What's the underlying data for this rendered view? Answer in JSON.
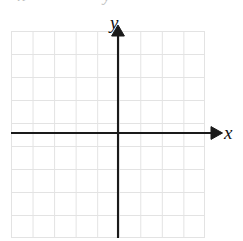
{
  "figure": {
    "kind": "blank-cartesian-coordinate-grid"
  },
  "axes": {
    "x_label": "x",
    "y_label": "y",
    "x_arrow_icon": "arrow-right-icon",
    "y_arrow_icon": "arrow-up-icon",
    "axis_color": "#1a1a1a",
    "origin_x": 118,
    "origin_y": 133
  },
  "grid": {
    "color": "#e3e3e3",
    "columns": 9,
    "rows": 9,
    "cell_width": 21.55,
    "cell_height": 23,
    "left": 11,
    "top": 31,
    "width": 194,
    "height": 207,
    "tick_labels": [],
    "plotted_points": [],
    "curves": []
  },
  "cut_off_text": {
    "visible": true,
    "glyphs": [
      {
        "text": "x",
        "left": 18
      },
      {
        "text": "y",
        "left": 103
      }
    ]
  },
  "chart_data": {
    "type": "scatter",
    "title": "",
    "subtitle": "",
    "xlabel": "x",
    "ylabel": "y",
    "x": [],
    "y": [],
    "series": [],
    "xticks": [],
    "yticks": [],
    "xlim": [
      -5,
      4
    ],
    "ylim": [
      -5,
      4
    ],
    "grid": true,
    "legend": false,
    "legend_position": "none",
    "annotations": [],
    "note": "Blank graph paper — no data is plotted; only the axes, arrowheads and grid are drawn."
  }
}
